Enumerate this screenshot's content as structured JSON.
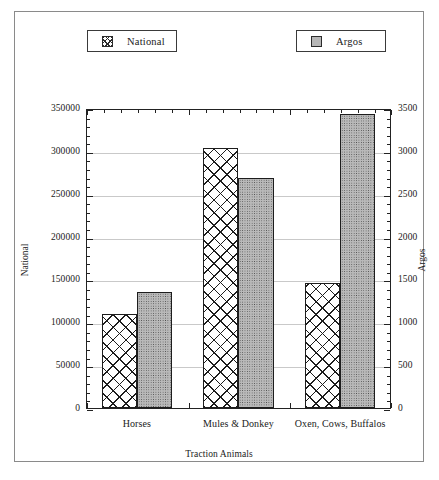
{
  "chart_data": {
    "type": "bar",
    "title": "",
    "categories": [
      "Horses",
      "Mules & Donkey",
      "Oxen, Cows, Buffalos"
    ],
    "series": [
      {
        "name": "National",
        "axis": "left",
        "values": [
          110000,
          303000,
          146000
        ]
      },
      {
        "name": "Argos",
        "axis": "right",
        "values": [
          1350,
          2680,
          3430
        ]
      }
    ],
    "xlabel": "Traction Animals",
    "ylabel": "National",
    "y2label": "Argos",
    "ylim": [
      0,
      350000
    ],
    "y2lim": [
      0,
      3500
    ],
    "ytick_labels": [
      "0",
      "50000",
      "100000",
      "150000",
      "200000",
      "250000",
      "300000",
      "350000"
    ],
    "ytick_values": [
      0,
      50000,
      100000,
      150000,
      200000,
      250000,
      300000,
      350000
    ],
    "y2tick_labels": [
      "0",
      "500",
      "1000",
      "1500",
      "2000",
      "2500",
      "3000",
      "3500"
    ],
    "y2tick_values": [
      0,
      500,
      1000,
      1500,
      2000,
      2500,
      3000,
      3500
    ],
    "grid": true,
    "grid_axis": "y",
    "legend_position": "top",
    "minor_ticks_per_interval": 5,
    "colors": {
      "national_fill": "#ffffff",
      "national_pattern": "#1d1d1d",
      "argos_fill": "#b9b9b9",
      "argos_pattern": "#4a4a4a",
      "axis": "#222222",
      "grid": "#c9c9c9",
      "frame": "#8a8a8a"
    }
  },
  "legend": {
    "entries": [
      {
        "label": "National",
        "swatch": "cross-hatch-swatch"
      },
      {
        "label": "Argos",
        "swatch": "dotted-swatch"
      }
    ]
  }
}
